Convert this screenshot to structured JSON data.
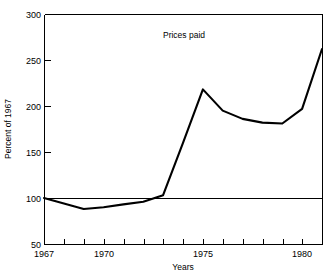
{
  "chart_data": {
    "type": "line",
    "title": "Prices paid",
    "xlabel": "Years",
    "ylabel": "Percent of 1967",
    "xlim": [
      1967,
      1981
    ],
    "ylim": [
      50,
      300
    ],
    "xticks": [
      1967,
      1968,
      1969,
      1970,
      1971,
      1972,
      1973,
      1974,
      1975,
      1976,
      1977,
      1978,
      1979,
      1980,
      1981
    ],
    "xtick_labels": [
      "1967",
      "",
      "",
      "1970",
      "",
      "",
      "",
      "",
      "1975",
      "",
      "",
      "",
      "",
      "1980",
      ""
    ],
    "yticks": [
      50,
      100,
      150,
      200,
      250,
      300
    ],
    "ytick_labels": [
      "50",
      "100",
      "150",
      "200",
      "250",
      "300"
    ],
    "grid": false,
    "reference_line": 100,
    "legend": "none",
    "x": [
      1967,
      1968,
      1969,
      1970,
      1971,
      1972,
      1973,
      1974,
      1975,
      1976,
      1977,
      1978,
      1979,
      1980,
      1981
    ],
    "values": [
      100,
      94,
      88,
      90,
      93,
      96,
      103,
      160,
      218,
      195,
      186,
      182,
      181,
      197,
      245
    ],
    "series": [
      {
        "name": "Prices paid",
        "values": [
          100,
          94,
          88,
          90,
          93,
          96,
          103,
          160,
          218,
          195,
          186,
          182,
          181,
          197,
          245
        ],
        "color": "#000000"
      }
    ],
    "end_value": 262,
    "annotations": [
      {
        "text": "Prices paid",
        "x": 1974,
        "y": 283
      }
    ]
  },
  "axes": {
    "y_title": "Percent of 1967",
    "x_title": "Years"
  },
  "colors": {
    "line": "#000000",
    "axis": "#000000",
    "reference": "#000000",
    "background": "#ffffff"
  }
}
